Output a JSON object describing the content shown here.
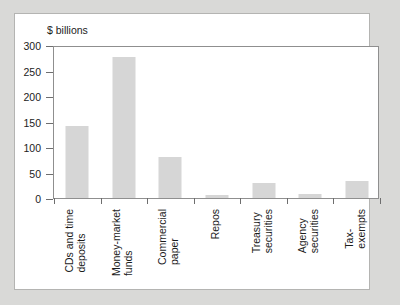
{
  "chart_data": {
    "type": "bar",
    "title": "",
    "subtitle": "",
    "xlabel": "",
    "ylabel": "$ billions",
    "ylim": [
      0,
      300
    ],
    "yticks": [
      0,
      50,
      100,
      150,
      200,
      250,
      300
    ],
    "ytick_labels": [
      "0",
      "50",
      "100",
      "150",
      "200",
      "250",
      "300"
    ],
    "grid": false,
    "legend": null,
    "categories": [
      "CDs and time\ndeposits",
      "Money-market\nfunds",
      "Commercial\npaper",
      "Repos",
      "Treasury\nsecurities",
      "Agency\nsecurities",
      "Tax-\nexempts"
    ],
    "values": [
      142,
      277,
      81,
      5,
      29,
      7,
      34
    ],
    "series": [
      {
        "name": "Holdings",
        "values": [
          142,
          277,
          81,
          5,
          29,
          7,
          34
        ]
      }
    ],
    "bar_color": "#d6d6d6",
    "axis_color": "#8f8f8f",
    "background": "#ffffff",
    "page_background": "#d9d9d7"
  }
}
